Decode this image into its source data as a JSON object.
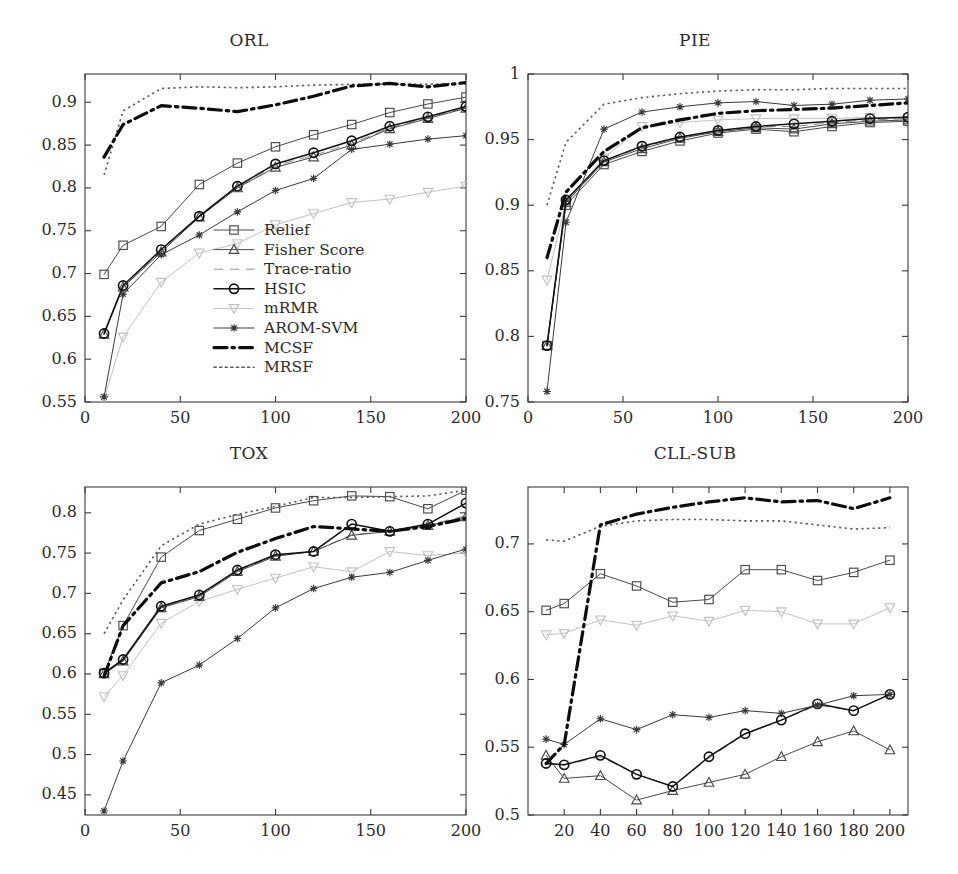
{
  "figure": {
    "panels_layout": "2x2 grid of line charts"
  },
  "legend": {
    "entries": [
      {
        "label": "Relief",
        "marker": "square",
        "dash": "solid",
        "color": "#4a4a4a",
        "width": 1.0
      },
      {
        "label": "Fisher Score",
        "marker": "triangle",
        "dash": "solid",
        "color": "#4a4a4a",
        "width": 1.0
      },
      {
        "label": "Trace-ratio",
        "marker": "none",
        "dash": "dashed",
        "color": "#8a8a8a",
        "width": 1.0
      },
      {
        "label": "HSIC",
        "marker": "circle",
        "dash": "solid",
        "color": "#111111",
        "width": 1.5
      },
      {
        "label": "mRMR",
        "marker": "nabla",
        "dash": "solid",
        "color": "#c2c2c2",
        "width": 1.0
      },
      {
        "label": "AROM-SVM",
        "marker": "star",
        "dash": "solid",
        "color": "#3a3a3a",
        "width": 1.0
      },
      {
        "label": "MCSF",
        "marker": "none",
        "dash": "dashdot",
        "color": "#0d0d0d",
        "width": 3.2
      },
      {
        "label": "MRSF",
        "marker": "none",
        "dash": "dotted",
        "color": "#5a5a5a",
        "width": 1.6
      }
    ]
  },
  "chart_data": [
    {
      "id": "orl",
      "type": "line",
      "title": "ORL",
      "xlabel": "",
      "ylabel": "",
      "xlim": [
        0,
        200
      ],
      "ylim": [
        0.55,
        0.933
      ],
      "xticks": [
        0,
        50,
        100,
        150,
        200
      ],
      "xticklabels": [
        "0",
        "50",
        "100",
        "150",
        "200"
      ],
      "yticks": [
        0.55,
        0.6,
        0.65,
        0.7,
        0.75,
        0.8,
        0.85,
        0.9
      ],
      "yticklabels": [
        "0.55",
        "0.6",
        "0.65",
        "0.7",
        "0.75",
        "0.8",
        "0.85",
        "0.9"
      ],
      "x": [
        10,
        20,
        40,
        60,
        80,
        100,
        120,
        140,
        160,
        180,
        200
      ],
      "series": [
        {
          "name": "Relief",
          "values": [
            0.699,
            0.733,
            0.755,
            0.804,
            0.829,
            0.848,
            0.862,
            0.874,
            0.888,
            0.898,
            0.906
          ]
        },
        {
          "name": "Fisher Score",
          "values": [
            0.629,
            0.684,
            0.725,
            0.766,
            0.8,
            0.824,
            0.836,
            0.85,
            0.869,
            0.881,
            0.893
          ]
        },
        {
          "name": "Trace-ratio",
          "values": [
            0.629,
            0.684,
            0.727,
            0.766,
            0.801,
            0.826,
            0.838,
            0.852,
            0.87,
            0.882,
            0.894
          ]
        },
        {
          "name": "HSIC",
          "values": [
            0.63,
            0.686,
            0.728,
            0.767,
            0.802,
            0.828,
            0.841,
            0.855,
            0.872,
            0.883,
            0.895
          ]
        },
        {
          "name": "mRMR",
          "values": [
            0.554,
            0.626,
            0.69,
            0.724,
            0.735,
            0.757,
            0.77,
            0.783,
            0.787,
            0.795,
            0.802
          ]
        },
        {
          "name": "AROM-SVM",
          "values": [
            0.556,
            0.676,
            0.722,
            0.745,
            0.772,
            0.797,
            0.811,
            0.845,
            0.851,
            0.857,
            0.861
          ]
        },
        {
          "name": "MCSF",
          "values": [
            0.836,
            0.874,
            0.896,
            0.893,
            0.889,
            0.897,
            0.907,
            0.919,
            0.922,
            0.918,
            0.923
          ]
        },
        {
          "name": "MRSF",
          "values": [
            0.815,
            0.89,
            0.916,
            0.918,
            0.917,
            0.918,
            0.92,
            0.921,
            0.921,
            0.921,
            0.922
          ]
        }
      ]
    },
    {
      "id": "pie",
      "type": "line",
      "title": "PIE",
      "xlabel": "",
      "ylabel": "",
      "xlim": [
        0,
        200
      ],
      "ylim": [
        0.75,
        1.0
      ],
      "xticks": [
        0,
        50,
        100,
        150,
        200
      ],
      "xticklabels": [
        "0",
        "50",
        "100",
        "150",
        "200"
      ],
      "yticks": [
        0.75,
        0.8,
        0.85,
        0.9,
        0.95,
        1.0
      ],
      "yticklabels": [
        "0.75",
        "0.8",
        "0.85",
        "0.9",
        "0.95",
        "1"
      ],
      "x": [
        10,
        20,
        40,
        60,
        80,
        100,
        120,
        140,
        160,
        180,
        200
      ],
      "series": [
        {
          "name": "Relief",
          "values": [
            0.793,
            0.9,
            0.931,
            0.941,
            0.949,
            0.955,
            0.958,
            0.956,
            0.96,
            0.963,
            0.964
          ]
        },
        {
          "name": "Fisher Score",
          "values": [
            0.793,
            0.902,
            0.933,
            0.943,
            0.951,
            0.956,
            0.959,
            0.958,
            0.962,
            0.964,
            0.965
          ]
        },
        {
          "name": "Trace-ratio",
          "values": [
            0.793,
            0.903,
            0.934,
            0.944,
            0.952,
            0.957,
            0.96,
            0.96,
            0.963,
            0.965,
            0.966
          ]
        },
        {
          "name": "HSIC",
          "values": [
            0.793,
            0.904,
            0.934,
            0.945,
            0.952,
            0.957,
            0.96,
            0.962,
            0.964,
            0.966,
            0.967
          ]
        },
        {
          "name": "mRMR",
          "values": [
            0.843,
            0.902,
            0.936,
            0.96,
            0.963,
            0.965,
            0.966,
            0.966,
            0.966,
            0.967,
            0.967
          ]
        },
        {
          "name": "AROM-SVM",
          "values": [
            0.758,
            0.887,
            0.958,
            0.971,
            0.975,
            0.978,
            0.979,
            0.976,
            0.977,
            0.98,
            0.981
          ]
        },
        {
          "name": "MCSF",
          "values": [
            0.86,
            0.91,
            0.941,
            0.959,
            0.965,
            0.97,
            0.972,
            0.973,
            0.974,
            0.976,
            0.978
          ]
        },
        {
          "name": "MRSF",
          "values": [
            0.9,
            0.948,
            0.977,
            0.982,
            0.985,
            0.987,
            0.988,
            0.988,
            0.989,
            0.989,
            0.989
          ]
        }
      ]
    },
    {
      "id": "tox",
      "type": "line",
      "title": "TOX",
      "xlabel": "",
      "ylabel": "",
      "xlim": [
        0,
        200
      ],
      "ylim": [
        0.425,
        0.832
      ],
      "xticks": [
        0,
        50,
        100,
        150,
        200
      ],
      "xticklabels": [
        "0",
        "50",
        "100",
        "150",
        "200"
      ],
      "yticks": [
        0.45,
        0.5,
        0.55,
        0.6,
        0.65,
        0.7,
        0.75,
        0.8
      ],
      "yticklabels": [
        "0.45",
        "0.5",
        "0.55",
        "0.6",
        "0.65",
        "0.7",
        "0.75",
        "0.8"
      ],
      "x": [
        10,
        20,
        40,
        60,
        80,
        100,
        120,
        140,
        160,
        180,
        200
      ],
      "series": [
        {
          "name": "Relief",
          "values": [
            0.601,
            0.66,
            0.745,
            0.778,
            0.792,
            0.806,
            0.815,
            0.821,
            0.82,
            0.805,
            0.828
          ]
        },
        {
          "name": "Fisher Score",
          "values": [
            0.6,
            0.616,
            0.682,
            0.696,
            0.727,
            0.746,
            0.752,
            0.772,
            0.777,
            0.784,
            0.795
          ]
        },
        {
          "name": "Trace-ratio",
          "values": [
            0.6,
            0.617,
            0.683,
            0.697,
            0.728,
            0.747,
            0.752,
            0.773,
            0.777,
            0.785,
            0.796
          ]
        },
        {
          "name": "HSIC",
          "values": [
            0.601,
            0.618,
            0.684,
            0.698,
            0.729,
            0.748,
            0.752,
            0.786,
            0.777,
            0.786,
            0.812
          ]
        },
        {
          "name": "mRMR",
          "values": [
            0.572,
            0.598,
            0.663,
            0.69,
            0.705,
            0.719,
            0.733,
            0.727,
            0.752,
            0.747,
            0.75
          ]
        },
        {
          "name": "AROM-SVM",
          "values": [
            0.43,
            0.492,
            0.589,
            0.611,
            0.644,
            0.682,
            0.706,
            0.72,
            0.726,
            0.741,
            0.755
          ]
        },
        {
          "name": "MCSF",
          "values": [
            0.597,
            0.66,
            0.713,
            0.727,
            0.751,
            0.768,
            0.783,
            0.78,
            0.777,
            0.783,
            0.793
          ]
        },
        {
          "name": "MRSF",
          "values": [
            0.65,
            0.692,
            0.759,
            0.786,
            0.798,
            0.808,
            0.819,
            0.819,
            0.82,
            0.821,
            0.828
          ]
        }
      ]
    },
    {
      "id": "cll-sub",
      "type": "line",
      "title": "CLL-SUB",
      "xlabel": "",
      "ylabel": "",
      "xlim": [
        0,
        210
      ],
      "ylim": [
        0.5,
        0.742
      ],
      "xticks": [
        20,
        40,
        60,
        80,
        100,
        120,
        140,
        160,
        180,
        200
      ],
      "xticklabels": [
        "20",
        "40",
        "60",
        "80",
        "100",
        "120",
        "140",
        "160",
        "180",
        "200"
      ],
      "yticks": [
        0.5,
        0.55,
        0.6,
        0.65,
        0.7
      ],
      "yticklabels": [
        "0.5",
        "0.55",
        "0.6",
        "0.65",
        "0.7"
      ],
      "x": [
        10,
        20,
        40,
        60,
        80,
        100,
        120,
        140,
        160,
        180,
        200
      ],
      "series": [
        {
          "name": "Relief",
          "values": [
            0.651,
            0.656,
            0.678,
            0.669,
            0.657,
            0.659,
            0.681,
            0.681,
            0.673,
            0.679,
            0.688
          ]
        },
        {
          "name": "Fisher Score",
          "values": [
            0.544,
            0.527,
            0.529,
            0.511,
            0.518,
            0.524,
            0.53,
            0.543,
            0.554,
            0.562,
            0.548
          ]
        },
        {
          "name": "Trace-ratio",
          "values": [
            0.538,
            0.537,
            0.543,
            0.53,
            0.521,
            0.542,
            0.56,
            0.57,
            0.581,
            0.577,
            0.589
          ]
        },
        {
          "name": "HSIC",
          "values": [
            0.538,
            0.537,
            0.544,
            0.53,
            0.521,
            0.543,
            0.56,
            0.57,
            0.582,
            0.577,
            0.589
          ]
        },
        {
          "name": "mRMR",
          "values": [
            0.633,
            0.634,
            0.644,
            0.64,
            0.647,
            0.643,
            0.651,
            0.65,
            0.641,
            0.641,
            0.653
          ]
        },
        {
          "name": "AROM-SVM",
          "values": [
            0.556,
            0.552,
            0.571,
            0.563,
            0.574,
            0.572,
            0.577,
            0.575,
            0.581,
            0.588,
            0.589
          ]
        },
        {
          "name": "MCSF",
          "values": [
            0.538,
            0.552,
            0.714,
            0.722,
            0.727,
            0.731,
            0.734,
            0.731,
            0.732,
            0.726,
            0.734
          ]
        },
        {
          "name": "MRSF",
          "values": [
            0.703,
            0.702,
            0.713,
            0.717,
            0.718,
            0.718,
            0.717,
            0.717,
            0.714,
            0.711,
            0.712
          ]
        }
      ]
    }
  ]
}
